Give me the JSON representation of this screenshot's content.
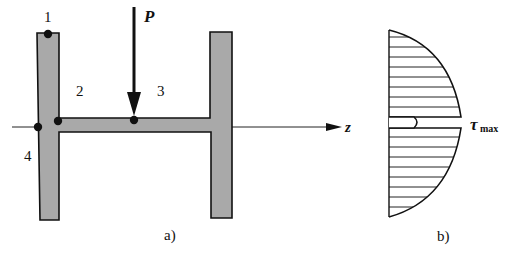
{
  "figure_a": {
    "caption": "a)",
    "load_label": "P",
    "axis_label": "z",
    "points": [
      {
        "id": "1",
        "label": "1"
      },
      {
        "id": "2",
        "label": "2"
      },
      {
        "id": "3",
        "label": "3"
      },
      {
        "id": "4",
        "label": "4"
      }
    ],
    "colors": {
      "section_fill": "#a9a9a9",
      "outline": "#111111"
    }
  },
  "figure_b": {
    "caption": "b)",
    "stress_label": "τ",
    "stress_subscript": "max",
    "colors": {
      "outline": "#111111",
      "hatch": "#222222"
    }
  }
}
